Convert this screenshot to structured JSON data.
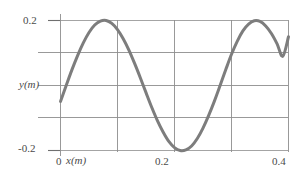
{
  "chart_data": {
    "type": "line",
    "title": "",
    "xlabel": "x(m)",
    "ylabel": "y(m)",
    "xlim": [
      0,
      0.4
    ],
    "ylim": [
      -0.2,
      0.2
    ],
    "grid": true,
    "legend": "none",
    "x_ticks": [
      {
        "value": 0,
        "label": "0"
      },
      {
        "value": 0.1,
        "label": ""
      },
      {
        "value": 0.2,
        "label": "0.2"
      },
      {
        "value": 0.3,
        "label": ""
      },
      {
        "value": 0.4,
        "label": "0.4"
      }
    ],
    "y_ticks": [
      {
        "value": 0.2,
        "label": "0.2"
      },
      {
        "value": 0.1,
        "label": ""
      },
      {
        "value": 0,
        "label": "y(m)"
      },
      {
        "value": -0.1,
        "label": ""
      },
      {
        "value": -0.2,
        "label": "-0.2"
      }
    ],
    "series": [
      {
        "name": "wave",
        "color": "#7d7d7d",
        "line_width": 3,
        "x": [
          0.0,
          0.01,
          0.02,
          0.03,
          0.04,
          0.05,
          0.06,
          0.07,
          0.08,
          0.09,
          0.1,
          0.11,
          0.12,
          0.13,
          0.14,
          0.15,
          0.16,
          0.17,
          0.18,
          0.19,
          0.2,
          0.21,
          0.22,
          0.23,
          0.24,
          0.25,
          0.26,
          0.27,
          0.28,
          0.29,
          0.3,
          0.31,
          0.32,
          0.33,
          0.34,
          0.35,
          0.36,
          0.37,
          0.38,
          0.39,
          0.4
        ],
        "y": [
          -0.049,
          0.0,
          0.048,
          0.092,
          0.131,
          0.163,
          0.186,
          0.198,
          0.2,
          0.191,
          0.172,
          0.144,
          0.109,
          0.068,
          0.024,
          -0.022,
          -0.067,
          -0.108,
          -0.143,
          -0.172,
          -0.191,
          -0.2,
          -0.198,
          -0.186,
          -0.163,
          -0.131,
          -0.092,
          -0.048,
          0.0,
          0.049,
          0.096,
          0.136,
          0.168,
          0.189,
          0.199,
          0.197,
          0.183,
          0.16,
          0.128,
          0.09,
          0.15
        ]
      }
    ],
    "annotations": {
      "x_axis_origin_label": "0",
      "x_axis_name": "x(m)",
      "y_axis_name": "y(m)",
      "y_max_label": "0.2",
      "y_min_label": "-0.2",
      "x_mid_label": "0.2",
      "x_max_label": "0.4"
    },
    "colors": {
      "curve": "#7d7d7d",
      "grid": "#8d8d8d",
      "axis": "#6f6f6f",
      "text": "#4a4a4a",
      "background": "#ffffff"
    }
  }
}
